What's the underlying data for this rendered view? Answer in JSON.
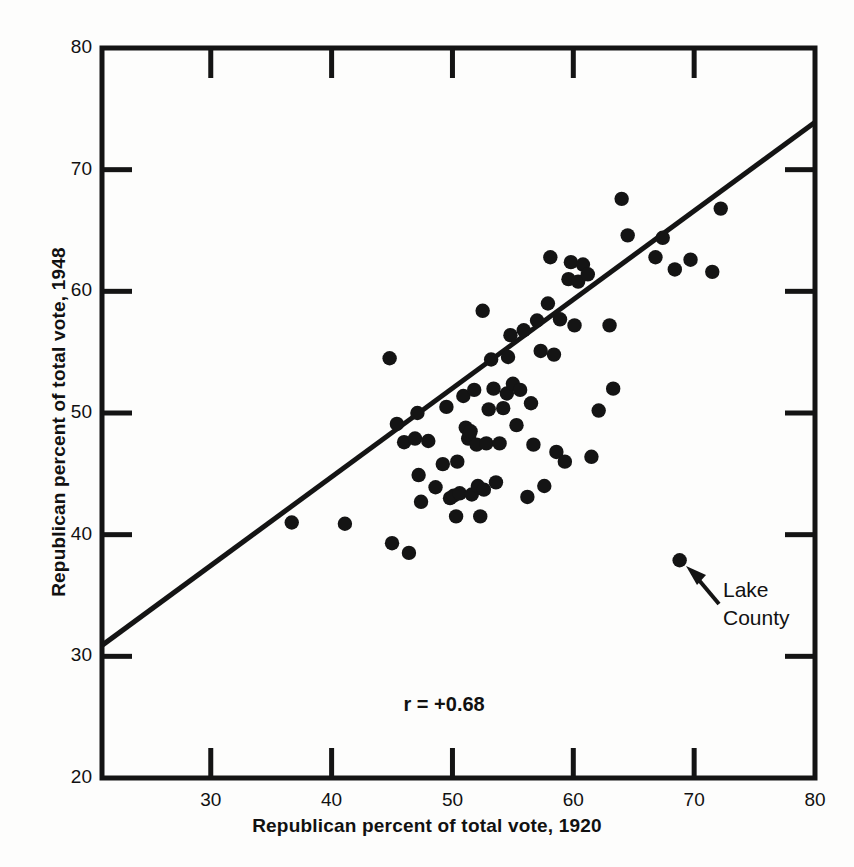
{
  "chart_data": {
    "type": "scatter",
    "title": "",
    "xlabel": "Republican percent of total vote, 1920",
    "ylabel": "Republican percent of total vote, 1948",
    "xlim": [
      21,
      80
    ],
    "ylim": [
      20,
      80
    ],
    "xticks": [
      30,
      40,
      50,
      60,
      70,
      80
    ],
    "yticks": [
      20,
      30,
      40,
      50,
      60,
      70,
      80
    ],
    "xtick_labels": [
      "30",
      "40",
      "50",
      "60",
      "70",
      "80"
    ],
    "ytick_labels": [
      "20",
      "30",
      "40",
      "50",
      "60",
      "70",
      "80"
    ],
    "grid": false,
    "legend": "none",
    "point_color": "#141414",
    "line_color": "#141414",
    "axis_color": "#141414",
    "annotations": [
      {
        "name": "correlation",
        "text": "r = +0.68",
        "x": 50.5,
        "y": 25.9
      },
      {
        "name": "lake-county-callout",
        "text": "Lake",
        "x": 72.3,
        "y": 35.2
      },
      {
        "name": "lake-county-callout",
        "text": "County",
        "x": 72.3,
        "y": 32.9
      }
    ],
    "trend_line": {
      "name": "regression-line",
      "x": [
        21.0,
        80.0
      ],
      "y": [
        30.9,
        73.9
      ]
    },
    "series": [
      {
        "name": "Illinois counties",
        "points": [
          [
            36.7,
            41.0
          ],
          [
            41.1,
            40.9
          ],
          [
            44.8,
            54.5
          ],
          [
            45.0,
            39.3
          ],
          [
            45.4,
            49.1
          ],
          [
            46.0,
            47.6
          ],
          [
            46.4,
            38.5
          ],
          [
            46.9,
            47.9
          ],
          [
            47.1,
            50.0
          ],
          [
            47.2,
            44.9
          ],
          [
            47.4,
            42.7
          ],
          [
            48.0,
            47.7
          ],
          [
            48.6,
            43.9
          ],
          [
            49.2,
            45.8
          ],
          [
            49.5,
            50.5
          ],
          [
            49.8,
            43.0
          ],
          [
            50.1,
            43.2
          ],
          [
            50.3,
            41.5
          ],
          [
            50.4,
            46.0
          ],
          [
            50.6,
            43.4
          ],
          [
            50.9,
            51.4
          ],
          [
            51.1,
            48.8
          ],
          [
            51.3,
            47.9
          ],
          [
            51.4,
            48.2
          ],
          [
            51.5,
            48.5
          ],
          [
            51.6,
            43.3
          ],
          [
            51.8,
            51.9
          ],
          [
            52.0,
            47.4
          ],
          [
            52.1,
            44.0
          ],
          [
            52.3,
            41.5
          ],
          [
            52.5,
            58.4
          ],
          [
            52.6,
            43.7
          ],
          [
            52.8,
            47.5
          ],
          [
            53.0,
            50.3
          ],
          [
            53.2,
            54.4
          ],
          [
            53.4,
            52.0
          ],
          [
            53.6,
            44.3
          ],
          [
            53.9,
            47.5
          ],
          [
            54.2,
            50.4
          ],
          [
            54.5,
            51.6
          ],
          [
            54.6,
            54.6
          ],
          [
            54.8,
            56.4
          ],
          [
            55.0,
            52.4
          ],
          [
            55.3,
            49.0
          ],
          [
            55.6,
            51.9
          ],
          [
            55.9,
            56.8
          ],
          [
            56.2,
            43.1
          ],
          [
            56.5,
            50.8
          ],
          [
            56.7,
            47.4
          ],
          [
            57.0,
            57.6
          ],
          [
            57.3,
            55.1
          ],
          [
            57.6,
            44.0
          ],
          [
            57.9,
            59.0
          ],
          [
            58.1,
            62.8
          ],
          [
            58.4,
            54.8
          ],
          [
            58.6,
            46.8
          ],
          [
            58.9,
            57.7
          ],
          [
            59.3,
            46.0
          ],
          [
            59.6,
            61.0
          ],
          [
            59.8,
            62.4
          ],
          [
            60.1,
            57.2
          ],
          [
            60.4,
            60.8
          ],
          [
            60.8,
            62.2
          ],
          [
            61.2,
            61.4
          ],
          [
            61.5,
            46.4
          ],
          [
            62.1,
            50.2
          ],
          [
            63.0,
            57.2
          ],
          [
            63.3,
            52.0
          ],
          [
            64.0,
            67.6
          ],
          [
            64.5,
            64.6
          ],
          [
            66.8,
            62.8
          ],
          [
            67.4,
            64.4
          ],
          [
            68.4,
            61.8
          ],
          [
            68.8,
            37.9
          ],
          [
            69.7,
            62.6
          ],
          [
            71.5,
            61.6
          ],
          [
            72.2,
            66.8
          ]
        ]
      }
    ]
  },
  "figure": {
    "axis_title_x": "Republican percent of total vote, 1920",
    "axis_title_y": "Republican percent of total vote, 1948",
    "r_text": "r = +0.68",
    "callout_line_1": "Lake",
    "callout_line_2": "County",
    "x_labels": [
      "30",
      "40",
      "50",
      "60",
      "70",
      "80"
    ],
    "y_labels": [
      "80",
      "70",
      "60",
      "50",
      "40",
      "30",
      "20"
    ]
  }
}
